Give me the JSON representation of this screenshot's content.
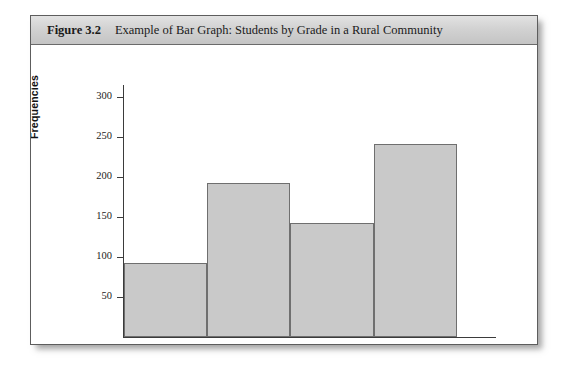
{
  "figure": {
    "number_label": "Figure 3.2",
    "caption": "Example of Bar Graph: Students by Grade in a Rural Community"
  },
  "chart_data": {
    "type": "bar",
    "title": "Example of Bar Graph: Students by Grade in a Rural Community",
    "categories": [
      "1",
      "2",
      "3",
      "4"
    ],
    "values": [
      92,
      192,
      142,
      241
    ],
    "xlabel": "",
    "ylabel": "Frequencies",
    "ylim": [
      0,
      315
    ],
    "yticks": [
      50,
      100,
      150,
      200,
      250,
      300
    ],
    "ytick_labels": [
      "50",
      "100",
      "150",
      "200",
      "250",
      "300"
    ],
    "grid": false,
    "legend": false,
    "bar_fill_color": "#c9c9c9",
    "bar_border_color": "#6f6f6f",
    "axis_color": "#3b3b3b"
  }
}
